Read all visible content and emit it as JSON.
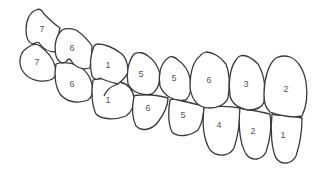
{
  "diagram": {
    "title": "",
    "upper_row": [
      {
        "label": "7"
      },
      {
        "label": "6"
      },
      {
        "label": "1"
      },
      {
        "label": "5"
      },
      {
        "label": "5"
      },
      {
        "label": "6"
      },
      {
        "label": "3"
      },
      {
        "label": "2"
      }
    ],
    "lower_row": [
      {
        "label": "7"
      },
      {
        "label": "6"
      },
      {
        "label": "1"
      },
      {
        "label": "6"
      },
      {
        "label": "5"
      },
      {
        "label": "4"
      },
      {
        "label": "2"
      },
      {
        "label": "1"
      }
    ],
    "colors": {
      "stroke": "#3a3a3a",
      "fill": "#ffffff",
      "label": "#555555"
    }
  }
}
